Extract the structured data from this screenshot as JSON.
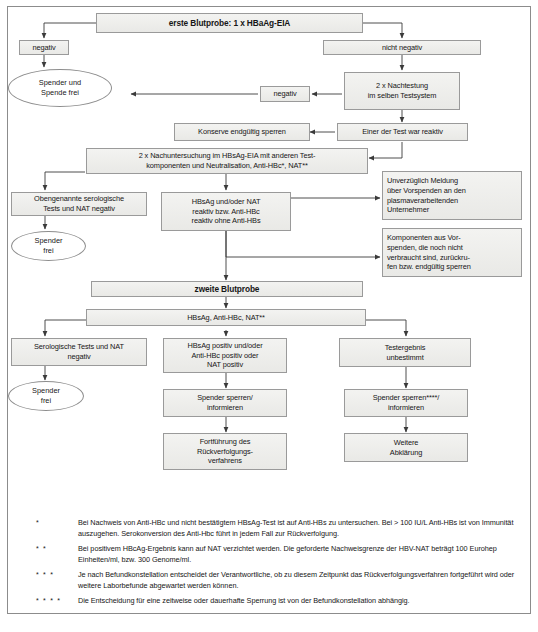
{
  "diagram": {
    "colors": {
      "box_border": "#9a9a9a",
      "box_fill_top": "#f3f3f1",
      "box_fill_bottom": "#e9e9e6",
      "line": "#3a3a3a",
      "frame": "#8c8c8c",
      "text": "#161616"
    },
    "nodes": {
      "first_sample": "erste Blutprobe: 1 x HBaAg-EIA",
      "negativ_1": "negativ",
      "nicht_negativ": "nicht negativ",
      "spender_spende_frei": "Spender und\nSpende frei",
      "negativ_2": "negativ",
      "nachtestung": "2 x Nachtestung\nim selben Testsystem",
      "konserve_sperren": "Konserve endgültig sperren",
      "einer_reaktiv": "Einer der Test war reaktiv",
      "nachuntersuchung": "2 x Nachuntersuchung im HBsAg-EIA mit anderen Test-\nkomponenten und Neutralisation, Anti-HBc*, NAT**",
      "obengenannte_negativ": "Obengenannte serologische\nTests und NAT negativ",
      "hbsag_reaktiv": "HBsAg und/oder NAT\nreaktiv bzw. Anti-HBc\nreaktiv ohne Anti-HBs",
      "spender_frei_1": "Spender\nfrei",
      "meldung_unternehmer": "Unverzüglich Meldung\nüber Vorspenden an den\nplasmaverarbeitenden\nUnternehmer",
      "komponenten_vorspenden": "Komponenten aus Vor-\nspenden, die noch nicht\nverbraucht sind, zurückru-\nfen bzw. endgültig sperren",
      "second_sample": "zweite Blutprobe",
      "tests_row": "HBsAg,        Anti-HBc,   NAT**",
      "serologische_negativ": "Serologische Tests und NAT\nnegativ",
      "hbsag_positiv": "HBsAg positiv und/oder\nAnti-HBc positiv oder\nNAT positiv",
      "testergebnis_unbestimmt": "Testergebnis\nunbestimmt",
      "spender_frei_2": "Spender\nfrei",
      "spender_sperren_1": "Spender sperren/\ninformieren",
      "spender_sperren_2": "Spender sperren****/\ninformieren",
      "fortfuehrung": "Fortführung des\nRückverfolgungs-\nverfahrens",
      "weitere_abklaerung": "Weitere\nAbklärung"
    },
    "footnotes": [
      {
        "mark": "*",
        "text": "Bei Nachweis von Anti-HBc und nicht bestätigtem HBsAg-Test ist auf Anti-HBs zu untersuchen. Bei > 100 IU/L Anti-HBs ist von Immunität auszugehen. Serokonversion des Anti-Hbc führt in jedem Fall zur Rückverfolgung."
      },
      {
        "mark": "* *",
        "text": "Bei positivem HBcAg-Ergebnis kann auf NAT verzichtet werden. Die geforderte Nachweisgrenze der HBV-NAT beträgt 100 Eurohep Einheiten/ml, bzw. 300 Genome/ml."
      },
      {
        "mark": "* * *",
        "text": "Je nach Befundkonstellation entscheidet der Verantwortliche, ob zu diesem Zeitpunkt das Rückverfolgungsverfahren fortgeführt wird oder weitere Laborbefunde abgewartet werden können."
      },
      {
        "mark": "* * * *",
        "text": "Die Entscheidung für eine zeitweise oder dauerhafte Sperrung ist von der Befundkonstellation abhängig."
      }
    ],
    "caption": ""
  }
}
